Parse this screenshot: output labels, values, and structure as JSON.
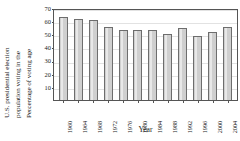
{
  "chart_data": {
    "type": "bar",
    "title": "",
    "xlabel": "Year",
    "ylabel": "Percentage of voting age population voting in the U.S. presidential election",
    "ylabel_lines": [
      "U.S. presidential election",
      "population voting in the",
      "Percentage of voting age"
    ],
    "categories": [
      "1960",
      "1964",
      "1968",
      "1972",
      "1976",
      "1980",
      "1984",
      "1988",
      "1992",
      "1996",
      "2000",
      "2004"
    ],
    "values": [
      63,
      62,
      61,
      55.5,
      53.5,
      53,
      53,
      50,
      55,
      49,
      51.5,
      55.5
    ],
    "ylim": [
      0,
      70
    ],
    "yticks": [
      70,
      60,
      50,
      40,
      30,
      20,
      10
    ],
    "grid": true,
    "legend": "none",
    "bar_color": "#cfcfcf",
    "bar_border_color": "#6d6d6d",
    "axis_color": "#555555",
    "text_color": "#1a1a1a"
  }
}
